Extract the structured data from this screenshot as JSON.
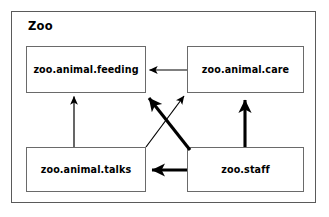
{
  "diagram": {
    "type": "package-dependency-diagram",
    "container": {
      "name": "zoo-package",
      "title": "Zoo"
    },
    "packages": [
      {
        "id": "feeding",
        "label": "zoo.animal.feeding",
        "position": "top-left"
      },
      {
        "id": "care",
        "label": "zoo.animal.care",
        "position": "top-right"
      },
      {
        "id": "talks",
        "label": "zoo.animal.talks",
        "position": "bottom-left"
      },
      {
        "id": "staff",
        "label": "zoo.staff",
        "position": "bottom-right"
      }
    ],
    "edges": [
      {
        "id": "care-to-feeding",
        "from": "zoo.animal.care",
        "to": "zoo.animal.feeding",
        "weight": "thin",
        "direction": "right-to-left"
      },
      {
        "id": "talks-to-feeding",
        "from": "zoo.animal.talks",
        "to": "zoo.animal.feeding",
        "weight": "thin",
        "direction": "bottom-to-top"
      },
      {
        "id": "talks-to-care",
        "from": "zoo.animal.talks",
        "to": "zoo.animal.care",
        "weight": "thin",
        "direction": "diagonal-up-right"
      },
      {
        "id": "staff-to-care",
        "from": "zoo.staff",
        "to": "zoo.animal.care",
        "weight": "thick",
        "direction": "bottom-to-top"
      },
      {
        "id": "staff-to-talks",
        "from": "zoo.staff",
        "to": "zoo.animal.talks",
        "weight": "thick",
        "direction": "right-to-left"
      },
      {
        "id": "staff-to-feeding",
        "from": "zoo.staff",
        "to": "zoo.animal.feeding",
        "weight": "thick",
        "direction": "diagonal-up-left"
      }
    ],
    "colors": {
      "background": "#ffffff",
      "container_border": "#5a5a5a",
      "package_border": "#6a6a6a",
      "edge": "#000000",
      "text": "#000000"
    }
  }
}
